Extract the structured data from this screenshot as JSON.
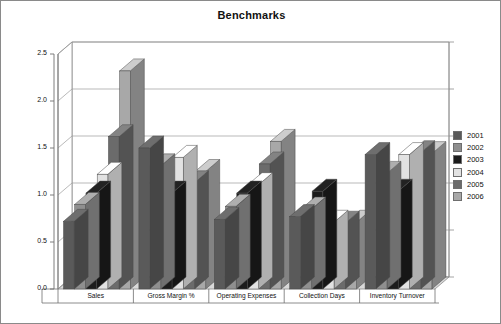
{
  "chart": {
    "title": "Benchmarks",
    "type": "bar"
  },
  "legend": {
    "position": "right",
    "items": [
      {
        "label": "2001",
        "color": "#5a5a5a"
      },
      {
        "label": "2002",
        "color": "#8f8f8f"
      },
      {
        "label": "2003",
        "color": "#1c1c1c"
      },
      {
        "label": "2004",
        "color": "#e2e2e2"
      },
      {
        "label": "2005",
        "color": "#6b6b6b"
      },
      {
        "label": "2006",
        "color": "#a8a8a8"
      }
    ]
  },
  "axis": {
    "y_ticks": [
      "0.0",
      "0.5",
      "1.0",
      "1.5",
      "2.0",
      "2.5"
    ],
    "y_min": 0.0,
    "y_max": 2.5
  },
  "categories": [
    "Sales",
    "Gross Margin %",
    "Operating Expenses",
    "Collection Days",
    "Inventory Turnover"
  ],
  "chart_data": {
    "type": "bar",
    "title": "Benchmarks",
    "xlabel": "",
    "ylabel": "",
    "ylim": [
      0.0,
      2.5
    ],
    "yticks": [
      0.0,
      0.5,
      1.0,
      1.5,
      2.0,
      2.5
    ],
    "grid": true,
    "legend_position": "right",
    "three_d": true,
    "categories": [
      "Sales",
      "Gross Margin %",
      "Operating Expenses",
      "Collection Days",
      "Inventory Turnover"
    ],
    "series": [
      {
        "name": "2001",
        "color": "#5a5a5a",
        "values": [
          0.72,
          1.5,
          0.74,
          0.77,
          1.43
        ]
      },
      {
        "name": "2002",
        "color": "#8f8f8f",
        "values": [
          0.9,
          1.31,
          0.88,
          0.85,
          1.23
        ]
      },
      {
        "name": "2003",
        "color": "#1c1c1c",
        "values": [
          1.02,
          1.02,
          1.02,
          1.04,
          1.04
        ]
      },
      {
        "name": "2004",
        "color": "#e2e2e2",
        "values": [
          1.22,
          1.4,
          1.11,
          0.71,
          1.43
        ]
      },
      {
        "name": "2005",
        "color": "#6b6b6b",
        "values": [
          1.62,
          1.13,
          1.33,
          0.7,
          1.45
        ]
      },
      {
        "name": "2006",
        "color": "#a8a8a8",
        "values": [
          2.32,
          1.25,
          1.57,
          0.71,
          1.44
        ]
      }
    ]
  }
}
